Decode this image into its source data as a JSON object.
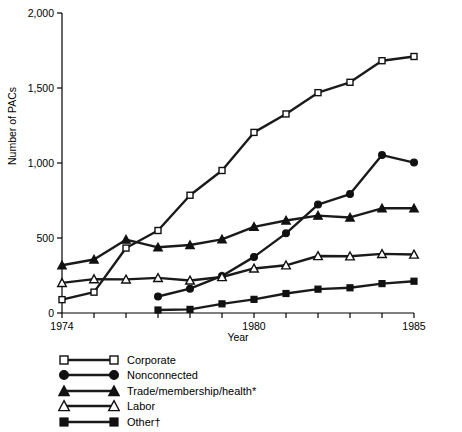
{
  "chart_data": {
    "type": "line",
    "title": "",
    "xlabel": "Year",
    "ylabel": "Number of PACs",
    "xlim": [
      1974,
      1985
    ],
    "ylim": [
      0,
      2000
    ],
    "xticks": [
      1974,
      1975,
      1976,
      1977,
      1978,
      1979,
      1980,
      1981,
      1982,
      1983,
      1984,
      1985
    ],
    "xtick_labels_shown": [
      "1974",
      "1980",
      "1985"
    ],
    "yticks": [
      0,
      500,
      1000,
      1500,
      2000
    ],
    "ytick_labels": [
      "0",
      "500",
      "1,000",
      "1,500",
      "2,000"
    ],
    "grid": false,
    "legend_position": "below-left",
    "x": [
      1974,
      1975,
      1976,
      1977,
      1978,
      1979,
      1980,
      1981,
      1982,
      1983,
      1984,
      1985
    ],
    "series": [
      {
        "name": "Corporate",
        "marker": "open-square",
        "color": "#000000",
        "values": [
          89,
          139,
          433,
          550,
          785,
          950,
          1204,
          1327,
          1469,
          1538,
          1682,
          1710
        ]
      },
      {
        "name": "Nonconnected",
        "marker": "filled-circle",
        "color": "#000000",
        "values": [
          null,
          null,
          null,
          110,
          162,
          247,
          374,
          531,
          723,
          793,
          1053,
          1003
        ]
      },
      {
        "name": "Trade/membership/health*",
        "marker": "filled-triangle",
        "color": "#000000",
        "values": [
          318,
          357,
          489,
          438,
          453,
          491,
          574,
          617,
          649,
          637,
          698,
          698
        ]
      },
      {
        "name": "Labor",
        "marker": "open-triangle",
        "color": "#000000",
        "values": [
          201,
          226,
          224,
          234,
          217,
          240,
          297,
          318,
          380,
          378,
          394,
          390
        ]
      },
      {
        "name": "Other†",
        "marker": "filled-square",
        "color": "#000000",
        "values": [
          null,
          null,
          null,
          20,
          24,
          61,
          91,
          130,
          159,
          168,
          196,
          212
        ]
      }
    ]
  },
  "axis": {
    "y_title": "Number of PACs",
    "x_title": "Year",
    "y_tick_labels": [
      "2,000",
      "1,500",
      "1,000",
      "500",
      "0"
    ],
    "x_tick_labels": [
      "1974",
      "1980",
      "1985"
    ]
  },
  "legend": {
    "items": [
      {
        "label": "Corporate",
        "marker": "open-square"
      },
      {
        "label": "Nonconnected",
        "marker": "filled-circle"
      },
      {
        "label": "Trade/membership/health*",
        "marker": "filled-triangle"
      },
      {
        "label": "Labor",
        "marker": "open-triangle"
      },
      {
        "label": "Other†",
        "marker": "filled-square"
      }
    ]
  },
  "colors": {
    "line": "#1a1a1a",
    "axis": "#000000",
    "background": "#ffffff"
  }
}
